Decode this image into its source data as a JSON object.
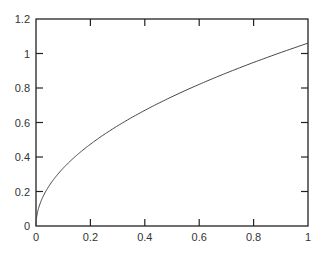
{
  "chart_data": {
    "type": "line",
    "title": "",
    "xlabel": "",
    "ylabel": "",
    "xlim": [
      0,
      1
    ],
    "ylim": [
      0,
      1.2
    ],
    "grid": false,
    "legend": null,
    "x_ticks": [
      "0",
      "0.2",
      "0.4",
      "0.6",
      "0.8",
      "1"
    ],
    "y_ticks": [
      "0",
      "0.2",
      "0.4",
      "0.6",
      "0.8",
      "1",
      "1.2"
    ],
    "series": [
      {
        "name": "curve",
        "description": "approx y = 1.06 * sqrt(x)",
        "x": [
          0,
          0.01,
          0.05,
          0.1,
          0.2,
          0.3,
          0.4,
          0.5,
          0.6,
          0.7,
          0.8,
          0.9,
          1.0
        ],
        "y": [
          0,
          0.106,
          0.237,
          0.335,
          0.474,
          0.581,
          0.67,
          0.75,
          0.821,
          0.887,
          0.948,
          1.006,
          1.06
        ]
      }
    ]
  },
  "colors": {
    "axis": "#222222",
    "line": "#444444",
    "text": "#333333",
    "background": "#ffffff"
  }
}
